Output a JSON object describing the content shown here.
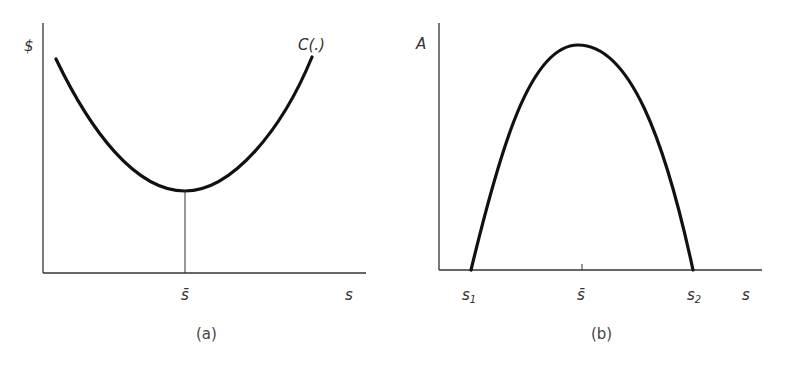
{
  "panel_a": {
    "caption": "(a)",
    "y_axis_label": "$",
    "x_axis_label": "s",
    "curve_label": "C(.)",
    "tick_label": "s̄",
    "curve_shape": "U-shaped cost curve with minimum at s̄"
  },
  "panel_b": {
    "caption": "(b)",
    "y_axis_label": "A",
    "x_axis_label": "s",
    "tick_labels": {
      "s1": "s",
      "s1_sub": "1",
      "sbar": "s̄",
      "s2": "s",
      "s2_sub": "2"
    },
    "curve_shape": "inverted-U curve from s1 to s2 peaking at s̄"
  },
  "colors": {
    "curve": "#111111",
    "axis": "#333333",
    "text": "#333333",
    "background": "#ffffff"
  }
}
